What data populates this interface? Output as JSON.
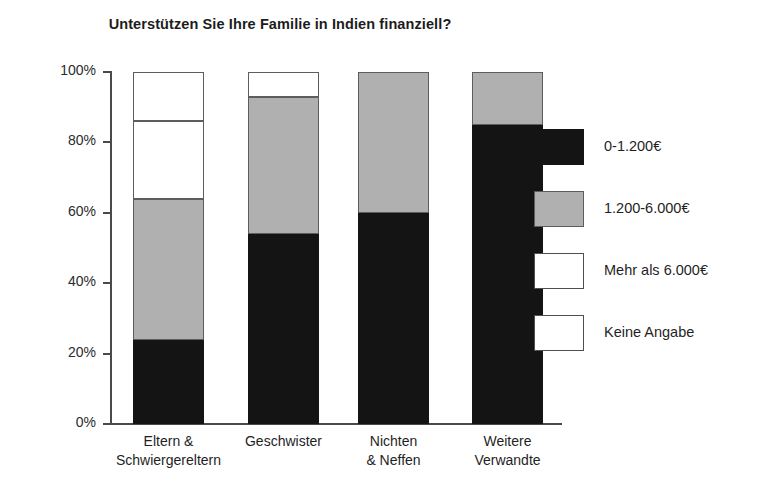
{
  "chart_data": {
    "type": "bar",
    "subtype": "stacked-percentage-column",
    "title": "Unterstützen Sie Ihre Familie in Indien finanziell?",
    "xlabel": "",
    "ylabel": "",
    "ylim": [
      0,
      100
    ],
    "yticks": [
      "0%",
      "20%",
      "40%",
      "60%",
      "80%",
      "100%"
    ],
    "ytick_values": [
      0,
      20,
      40,
      60,
      80,
      100
    ],
    "grid": false,
    "legend_position": "right",
    "categories": [
      "Eltern & Schwiergereltern",
      "Geschwister",
      "Nichten & Neffen",
      "Weitere Verwandte"
    ],
    "category_lines": [
      [
        "Eltern &",
        "Schwiergereltern"
      ],
      [
        "Geschwister",
        ""
      ],
      [
        "Nichten",
        "& Neffen"
      ],
      [
        "Weitere",
        "Verwandte"
      ]
    ],
    "series": [
      {
        "name": "0-1.200€",
        "color": "#141414",
        "values": [
          24,
          54,
          60,
          85
        ]
      },
      {
        "name": "1.200-6.000€",
        "color": "#b0b0b0",
        "values": [
          40,
          39,
          40,
          15
        ]
      },
      {
        "name": "Mehr als 6.000€",
        "color": "#ffffff",
        "values": [
          22,
          7,
          0,
          0
        ]
      },
      {
        "name": "Keine Angabe",
        "color": "#ffffff",
        "values": [
          14,
          0,
          0,
          0
        ]
      }
    ]
  },
  "legend": {
    "items": [
      {
        "label": "0-1.200€",
        "swatch": "black"
      },
      {
        "label": "1.200-6.000€",
        "swatch": "gray"
      },
      {
        "label": "Mehr als 6.000€",
        "swatch": "white"
      },
      {
        "label": "Keine Angabe",
        "swatch": "white"
      }
    ]
  },
  "axis": {
    "y_labels": [
      "100%",
      "80%",
      "60%",
      "40%",
      "20%",
      "0%"
    ]
  }
}
